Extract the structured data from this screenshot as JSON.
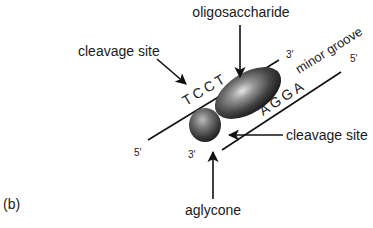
{
  "figure": {
    "panel_label": "(b)",
    "labels": {
      "oligosaccharide": "oligosaccharide",
      "cleavage_site_top": "cleavage site",
      "cleavage_site_bottom": "cleavage site",
      "aglycone": "aglycone",
      "minor_groove": "minor groove"
    },
    "strands": {
      "top": {
        "sequence": "TCCT",
        "end_left": "5′",
        "end_right": "3′"
      },
      "bottom": {
        "sequence": "AGGA",
        "end_left": "3′",
        "end_right": "5′"
      }
    },
    "colors": {
      "line": "#111111",
      "ellipse_dark": "#1c1c1c",
      "ellipse_light": "#d8d8d8",
      "text": "#1a1a1a"
    }
  }
}
